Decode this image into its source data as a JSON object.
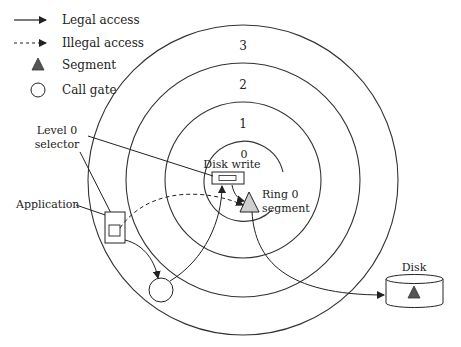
{
  "legend": {
    "items": [
      {
        "icon": "solid-arrow",
        "label": "Legal access"
      },
      {
        "icon": "dashed-arrow",
        "label": "Illegal access"
      },
      {
        "icon": "triangle",
        "label": "Segment"
      },
      {
        "icon": "circle",
        "label": "Call gate"
      }
    ]
  },
  "rings": {
    "labels": [
      "3",
      "2",
      "1",
      "0"
    ]
  },
  "labels": {
    "disk_write": "Disk write",
    "ring0_segment_line1": "Ring 0",
    "ring0_segment_line2": "segment",
    "level0_selector_line1": "Level 0",
    "level0_selector_line2": "selector",
    "application": "Application",
    "disk": "Disk"
  },
  "colors": {
    "line": "#222222",
    "segment_fill_light": "#cfcfcf",
    "segment_fill_dark": "#555555"
  }
}
